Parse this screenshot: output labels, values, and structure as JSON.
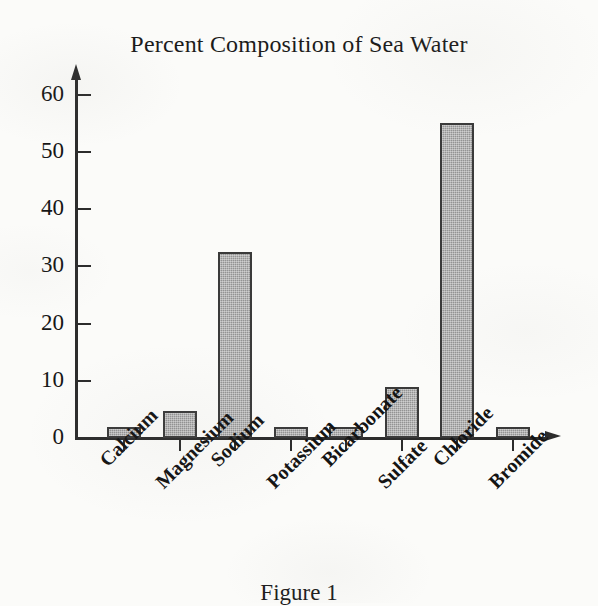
{
  "chart_data": {
    "type": "bar",
    "title": "Percent Composition of Sea Water",
    "xlabel": "",
    "ylabel": "",
    "ylim": [
      0,
      65
    ],
    "yticks": [
      0,
      10,
      20,
      30,
      40,
      50,
      60
    ],
    "ytick_labels": [
      "0",
      "10",
      "20",
      "30",
      "40",
      "50",
      "60"
    ],
    "grid": false,
    "legend": "none",
    "categories": [
      "Calcium",
      "Magnesium",
      "Sodium",
      "Potassium",
      "Bicarbonate",
      "Sulfate",
      "Chloride",
      "Bromide"
    ],
    "values": [
      2,
      4.8,
      32.5,
      2,
      2,
      9,
      55,
      2
    ],
    "bar_fill_color": "#939393",
    "bar_border_color": "#3a3a3a",
    "axis_color": "#2c2c2c"
  },
  "caption": {
    "text": "Figure 1"
  }
}
